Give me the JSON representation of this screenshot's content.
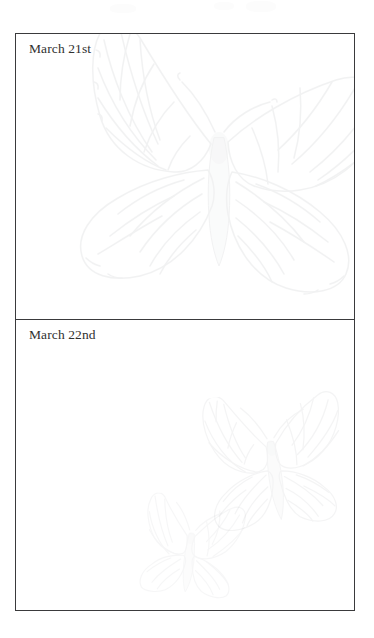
{
  "page": {
    "background_color": "#ffffff",
    "ink_color": "#30302f",
    "rule_color": "#3a3a3c"
  },
  "date_table": {
    "name": "date-table",
    "panels": [
      {
        "label": "March 21st",
        "watermark": "monarch-butterfly-large"
      },
      {
        "label": "March 22nd",
        "watermark": "monarch-butterfly-pair"
      }
    ]
  },
  "watermarks": [
    {
      "name": "butterfly-large-watermark",
      "opacity": "0.085"
    },
    {
      "name": "butterfly-medium-watermark",
      "opacity": "0.07"
    },
    {
      "name": "butterfly-small-watermark",
      "opacity": "0.055"
    }
  ]
}
